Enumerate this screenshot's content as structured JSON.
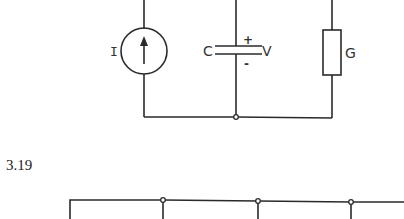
{
  "circuit_top": {
    "current_source_label": "I",
    "capacitor_label": "C",
    "voltage_label": "V",
    "plus_sign": "+",
    "minus_sign": "-",
    "conductance_label": "G"
  },
  "figure_number": "3.19",
  "colors": {
    "line": "#2a2a2a",
    "background": "#ffffff"
  }
}
